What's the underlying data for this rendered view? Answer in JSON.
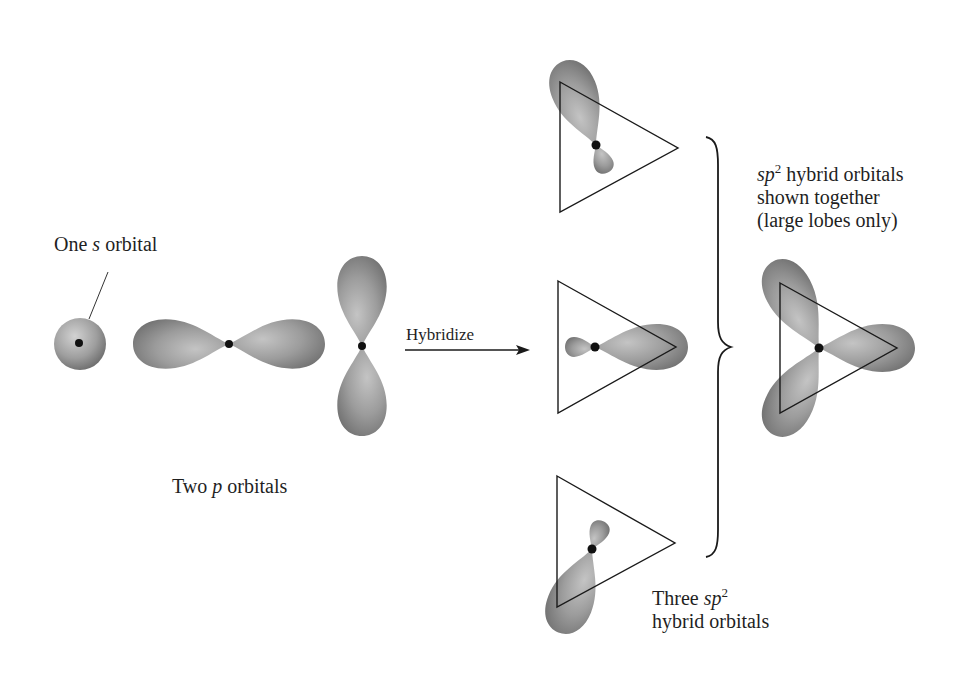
{
  "figure": {
    "colors": {
      "lobe_light": "#bdbdbd",
      "lobe_mid": "#9a9a9a",
      "lobe_dark": "#6e6e6e",
      "nucleus": "#111111",
      "line": "#1a1a1a",
      "background": "#ffffff"
    }
  },
  "labels": {
    "s_orbital": {
      "prefix": "One ",
      "italic": "s",
      "suffix": " orbital"
    },
    "p_orbitals": {
      "prefix": "Two ",
      "italic": "p",
      "suffix": " orbitals"
    },
    "arrow": "Hybridize",
    "three_hybrids": {
      "line1_prefix": "Three ",
      "italic": "sp",
      "sup": "2",
      "line2": "hybrid orbitals"
    },
    "together": {
      "italic": "sp",
      "sup": "2",
      "line1_suffix": " hybrid orbitals",
      "line2": "shown together",
      "line3": "(large lobes only)"
    }
  },
  "elements": {
    "s_orbital": {
      "center": [
        80,
        344
      ],
      "radius": 26
    },
    "p_orbital_horizontal": {
      "center": [
        229,
        344
      ],
      "lobe_length": 96,
      "lobe_width": 50
    },
    "p_orbital_vertical": {
      "center": [
        362,
        346
      ],
      "lobe_length": 90,
      "lobe_width": 50
    },
    "hybrid_top": {
      "nucleus": [
        596,
        145
      ],
      "triangle": [
        [
          560,
          82
        ],
        [
          678,
          148
        ],
        [
          560,
          212
        ]
      ],
      "large_lobe_angle_deg": 240
    },
    "hybrid_middle": {
      "nucleus": [
        595,
        347
      ],
      "triangle": [
        [
          558,
          281
        ],
        [
          676,
          347
        ],
        [
          558,
          413
        ]
      ],
      "large_lobe_angle_deg": 0
    },
    "hybrid_bottom": {
      "nucleus": [
        592,
        549
      ],
      "triangle": [
        [
          557,
          476
        ],
        [
          675,
          543
        ],
        [
          557,
          607
        ]
      ],
      "large_lobe_angle_deg": 120
    },
    "brace": {
      "x": 710,
      "top": 137,
      "bottom": 557,
      "tip": [
        731,
        347
      ]
    },
    "combined": {
      "nucleus": [
        819,
        348
      ],
      "triangle": [
        [
          780,
          283
        ],
        [
          897,
          348
        ],
        [
          780,
          413
        ]
      ]
    }
  }
}
